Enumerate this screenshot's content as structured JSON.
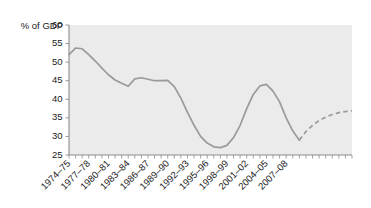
{
  "chart_data": {
    "type": "line",
    "title": "",
    "subtitle": "",
    "ylabel": "% of GDP",
    "xlabel": "",
    "ylim": [
      25,
      60
    ],
    "y_ticks": [
      25,
      30,
      35,
      40,
      45,
      50,
      55,
      60
    ],
    "grid": false,
    "legend": "none",
    "x_tick_labels": [
      "1974–75",
      "1977–78",
      "1980–81",
      "1983–84",
      "1986–87",
      "1989–90",
      "1992–93",
      "1995–96",
      "1998–99",
      "2001–02",
      "2004–05",
      "2007–08"
    ],
    "x_tick_label_indices": [
      0,
      3,
      6,
      9,
      12,
      15,
      18,
      21,
      24,
      27,
      30,
      33
    ],
    "x_categories": [
      "1974–75",
      "1975–76",
      "1976–77",
      "1977–78",
      "1978–79",
      "1979–80",
      "1980–81",
      "1981–82",
      "1982–83",
      "1983–84",
      "1984–85",
      "1985–86",
      "1986–87",
      "1987–88",
      "1988–89",
      "1989–90",
      "1990–91",
      "1991–92",
      "1992–93",
      "1993–94",
      "1994–95",
      "1995–96",
      "1996–97",
      "1997–98",
      "1998–99",
      "1999–00",
      "2000–01",
      "2001–02",
      "2002–03",
      "2003–04",
      "2004–05",
      "2005–06",
      "2006–07",
      "2007–08",
      "2008–09",
      "2009–10"
    ],
    "series": [
      {
        "name": "Actual",
        "style": "solid",
        "color": "#9a9a9a",
        "values": [
          52.0,
          53.8,
          53.6,
          52.0,
          50.3,
          48.4,
          46.6,
          45.2,
          44.3,
          43.5,
          45.5,
          45.8,
          45.4,
          45.0,
          45.0,
          45.1,
          43.4,
          40.3,
          36.5,
          33.0,
          30.0,
          28.2,
          27.2,
          27.0,
          27.6,
          29.7,
          33.0,
          37.5,
          41.3,
          43.6,
          44.0,
          42.2,
          39.3,
          35.0,
          31.5,
          29.0
        ]
      },
      {
        "name": "Projection",
        "style": "dashed",
        "color": "#9a9a9a",
        "start_index": 35,
        "values": [
          29.0,
          31.3,
          33.0,
          34.3,
          35.2,
          35.9,
          36.4,
          36.7,
          36.9
        ]
      }
    ]
  },
  "axis": {
    "y_label": "% of GDP"
  }
}
